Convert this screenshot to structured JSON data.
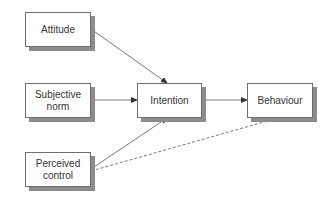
{
  "diagram": {
    "nodes": [
      {
        "id": "attitude",
        "label": "Attitude"
      },
      {
        "id": "subjective_norm",
        "label": "Subjective norm"
      },
      {
        "id": "perceived_control",
        "label": "Perceived control"
      },
      {
        "id": "intention",
        "label": "Intention"
      },
      {
        "id": "behaviour",
        "label": "Behaviour"
      }
    ],
    "edges": [
      {
        "from": "attitude",
        "to": "intention",
        "style": "solid"
      },
      {
        "from": "subjective_norm",
        "to": "intention",
        "style": "solid"
      },
      {
        "from": "perceived_control",
        "to": "intention",
        "style": "solid"
      },
      {
        "from": "intention",
        "to": "behaviour",
        "style": "solid"
      },
      {
        "from": "perceived_control",
        "to": "behaviour",
        "style": "dashed"
      }
    ]
  },
  "labels": {
    "attitude": "Attitude",
    "subjective_line1": "Subjective",
    "subjective_line2": "norm",
    "perceived_line1": "Perceived",
    "perceived_line2": "control",
    "intention": "Intention",
    "behaviour": "Behaviour"
  },
  "colors": {
    "border": "#6e6e6e",
    "shadow": "#8c8c8c",
    "arrow": "#444444",
    "text": "#333333"
  }
}
